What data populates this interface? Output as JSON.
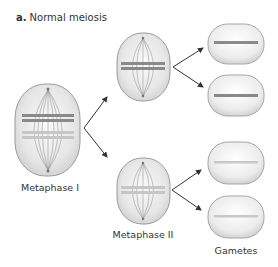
{
  "title": {
    "prefix": "a.",
    "text": "Normal meiosis"
  },
  "stages": [
    {
      "id": "metaphase-1",
      "label": "Metaphase I"
    },
    {
      "id": "metaphase-2",
      "label": "Metaphase II"
    },
    {
      "id": "gametes",
      "label": "Gametes"
    }
  ],
  "colors": {
    "cell_fill": "#e8e8e8",
    "cell_stroke": "#a0a0a0",
    "chromosome_dark": "#8a8a8a",
    "chromosome_light": "#c8c8c8",
    "spindle": "#9a9a9a",
    "arrow": "#333333",
    "text": "#333333"
  }
}
